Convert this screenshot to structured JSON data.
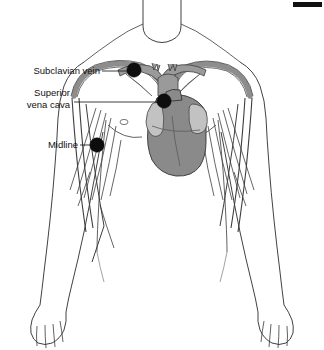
{
  "figure": {
    "width": 324,
    "height": 350,
    "background_color": "#ffffff"
  },
  "labels": [
    {
      "id": "subclavian-vein",
      "text": "Subclavian vein",
      "lines": [
        "Subclavian vein"
      ],
      "text_x": 100,
      "text_y": 74,
      "anchor": "end",
      "leader": {
        "x1": 102,
        "y1": 71,
        "x2": 133,
        "y2": 71
      },
      "marker": {
        "cx": 134,
        "cy": 70,
        "r": 7.2
      }
    },
    {
      "id": "superior-vena-cava",
      "text": "Superior vena cava",
      "lines": [
        "Superior",
        "vena cava"
      ],
      "text_x": 70,
      "text_y": 96,
      "anchor": "end",
      "leader": {
        "x1": 74,
        "y1": 102,
        "x2": 163,
        "y2": 102
      },
      "marker": {
        "cx": 164,
        "cy": 101,
        "r": 7.2
      }
    },
    {
      "id": "midline",
      "text": "Midline",
      "lines": [
        "Midline"
      ],
      "text_x": 78,
      "text_y": 148,
      "anchor": "end",
      "leader": {
        "x1": 80,
        "y1": 145,
        "x2": 96,
        "y2": 145
      },
      "marker": {
        "cx": 97,
        "cy": 145,
        "r": 7.2
      }
    }
  ],
  "anatomy": {
    "parts": [
      {
        "name": "neck",
        "kind": "outline"
      },
      {
        "name": "shoulders",
        "kind": "outline"
      },
      {
        "name": "torso",
        "kind": "outline"
      },
      {
        "name": "left-arm",
        "kind": "outline"
      },
      {
        "name": "right-arm",
        "kind": "outline"
      },
      {
        "name": "left-hand",
        "kind": "outline"
      },
      {
        "name": "right-hand",
        "kind": "outline"
      },
      {
        "name": "clavicle",
        "kind": "bone"
      },
      {
        "name": "ribs",
        "kind": "bone"
      },
      {
        "name": "subclavian-veins",
        "kind": "vessel"
      },
      {
        "name": "brachiocephalic-veins",
        "kind": "vessel"
      },
      {
        "name": "superior-vena-cava",
        "kind": "vessel"
      },
      {
        "name": "heart",
        "kind": "organ"
      },
      {
        "name": "right-atrial-appendage",
        "kind": "organ"
      },
      {
        "name": "left-atrial-appendage",
        "kind": "organ"
      }
    ]
  },
  "colors": {
    "outline": "#2b2b2b",
    "vessel_fill": "#8d8d8d",
    "vessel_edge": "#3d3d3d",
    "bone_fill": "#9a9a9a",
    "heart_dark": "#8a8a8a",
    "heart_light": "#c2c2c2",
    "marker": "#0d0d0d",
    "text": "#111111"
  },
  "artifact": {
    "name": "top-right-black-bar",
    "x": 293,
    "y": 2,
    "width": 29,
    "height": 5
  }
}
